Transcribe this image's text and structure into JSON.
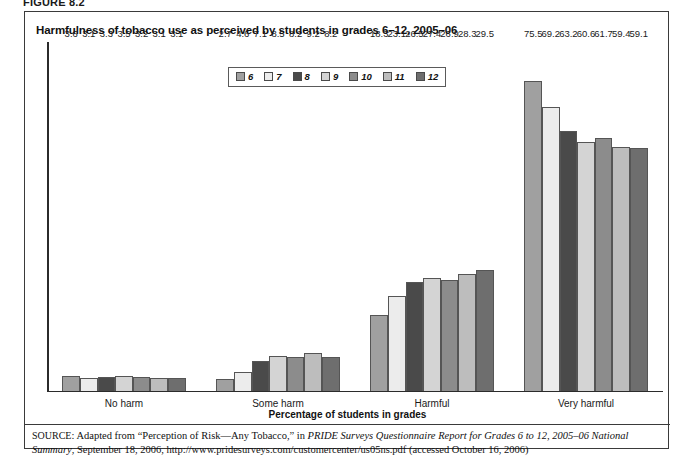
{
  "figure": {
    "label": "FIGURE 8.2"
  },
  "chart_title": "Harmfulness of tobacco use as perceived by students in grades 6–12, 2005–06",
  "axis_title": "Percentage of students in grades",
  "legend": {
    "entries": [
      {
        "label": "6",
        "color": "#a0a0a0"
      },
      {
        "label": "7",
        "color": "#ececec"
      },
      {
        "label": "8",
        "color": "#4a4a4a"
      },
      {
        "label": "9",
        "color": "#d4d4d4"
      },
      {
        "label": "10",
        "color": "#8c8c8c"
      },
      {
        "label": "11",
        "color": "#bdbdbd"
      },
      {
        "label": "12",
        "color": "#6e6e6e"
      }
    ]
  },
  "source": {
    "prefix": "SOURCE",
    "line1_a": ": Adapted from “Perception of Risk—Any Tobacco,” in ",
    "line1_italic": "PRIDE Surveys Questionnaire Report for Grades 6 to 12, 2005–06 National Summary",
    "line1_b": ", September 18, 2006, http://www.pridesurveys.com/customercenter/us05ns.pdf (accessed October 16, 2006)"
  },
  "chart_data": {
    "type": "bar",
    "title": "Harmfulness of tobacco use as perceived by students in grades 6–12, 2005–06",
    "xlabel": "Percentage of students in grades",
    "ylabel": "",
    "ylim": [
      0,
      80
    ],
    "grid": false,
    "legend_position": "top-center",
    "categories": [
      "No harm",
      "Some harm",
      "Harmful",
      "Very harmful"
    ],
    "series": [
      {
        "name": "6",
        "color": "#a0a0a0",
        "values": [
          3.6,
          2.7,
          18.3,
          75.5
        ]
      },
      {
        "name": "7",
        "color": "#ececec",
        "values": [
          3.1,
          4.6,
          23.1,
          69.2
        ]
      },
      {
        "name": "8",
        "color": "#4a4a4a",
        "values": [
          3.3,
          7.1,
          26.5,
          63.2
        ]
      },
      {
        "name": "9",
        "color": "#d4d4d4",
        "values": [
          3.5,
          8.5,
          27.4,
          60.6
        ]
      },
      {
        "name": "10",
        "color": "#8c8c8c",
        "values": [
          3.2,
          8.2,
          26.9,
          61.7
        ]
      },
      {
        "name": "11",
        "color": "#bdbdbd",
        "values": [
          3.1,
          9.2,
          28.3,
          59.4
        ]
      },
      {
        "name": "12",
        "color": "#6e6e6e",
        "values": [
          3.1,
          8.2,
          29.5,
          59.1
        ]
      }
    ]
  }
}
